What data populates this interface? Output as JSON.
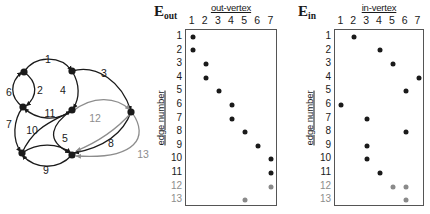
{
  "figure": {
    "panels": [
      "graph",
      "E_out matrix",
      "E_in matrix"
    ]
  },
  "graph": {
    "name": "directed-multigraph",
    "vertices": [
      {
        "id": "v1",
        "label": "",
        "x": 24,
        "y": 72
      },
      {
        "id": "v2",
        "label": "",
        "x": 72,
        "y": 71
      },
      {
        "id": "v3",
        "label": "",
        "x": 23,
        "y": 107
      },
      {
        "id": "v4",
        "label": "",
        "x": 72,
        "y": 110
      },
      {
        "id": "v5",
        "label": "",
        "x": 22,
        "y": 153
      },
      {
        "id": "v6",
        "label": "",
        "x": 72,
        "y": 155
      },
      {
        "id": "v7",
        "label": "",
        "x": 131,
        "y": 112
      }
    ],
    "edge_labels": [
      {
        "id": "1",
        "text": "1",
        "x": 48,
        "y": 59,
        "gray": false
      },
      {
        "id": "2",
        "text": "2",
        "x": 40,
        "y": 90,
        "gray": false
      },
      {
        "id": "3",
        "text": "3",
        "x": 104,
        "y": 73,
        "gray": false
      },
      {
        "id": "4",
        "text": "4",
        "x": 63,
        "y": 90,
        "gray": false
      },
      {
        "id": "5",
        "text": "5",
        "x": 65,
        "y": 138,
        "gray": false
      },
      {
        "id": "6",
        "text": "6",
        "x": 9,
        "y": 92,
        "gray": false
      },
      {
        "id": "7",
        "text": "7",
        "x": 9,
        "y": 124,
        "gray": false
      },
      {
        "id": "8",
        "text": "8",
        "x": 111,
        "y": 143,
        "gray": false
      },
      {
        "id": "9",
        "text": "9",
        "x": 46,
        "y": 170,
        "gray": false
      },
      {
        "id": "10",
        "text": "10",
        "x": 32,
        "y": 130,
        "gray": false
      },
      {
        "id": "11",
        "text": "11",
        "x": 50,
        "y": 113,
        "gray": false
      },
      {
        "id": "12",
        "text": "12",
        "x": 95,
        "y": 118,
        "gray": true
      },
      {
        "id": "13",
        "text": "13",
        "x": 143,
        "y": 154,
        "gray": true
      }
    ]
  },
  "eout": {
    "symbol": "E",
    "subscript": "out",
    "column_title": "out-vertex",
    "column_labels": [
      "1",
      "2",
      "3",
      "4",
      "5",
      "6",
      "7"
    ],
    "row_axis_title": "edge number",
    "row_labels": [
      "1",
      "2",
      "3",
      "4",
      "5",
      "6",
      "7",
      "8",
      "9",
      "10",
      "11",
      "12",
      "13"
    ]
  },
  "ein": {
    "symbol": "E",
    "subscript": "in",
    "column_title": "in-vertex",
    "column_labels": [
      "1",
      "2",
      "3",
      "4",
      "5",
      "6",
      "7"
    ],
    "row_axis_title": "edge number",
    "row_labels": [
      "1",
      "2",
      "3",
      "4",
      "5",
      "6",
      "7",
      "8",
      "9",
      "10",
      "11",
      "12",
      "13"
    ]
  },
  "chart_data": [
    {
      "type": "scatter",
      "name": "E_out",
      "title": "E_out",
      "xlabel": "out-vertex",
      "ylabel": "edge number",
      "x": [
        1,
        2,
        3,
        4,
        5,
        6,
        7
      ],
      "y": [
        1,
        2,
        3,
        4,
        5,
        6,
        7,
        8,
        9,
        10,
        11,
        12,
        13
      ],
      "xlim": [
        0.5,
        7.5
      ],
      "ylim": [
        0.5,
        13.5
      ],
      "grid": false,
      "points": [
        {
          "edge": 1,
          "vertex": 1,
          "color": "#1a1a1a"
        },
        {
          "edge": 2,
          "vertex": 1,
          "color": "#1a1a1a"
        },
        {
          "edge": 3,
          "vertex": 2,
          "color": "#1a1a1a"
        },
        {
          "edge": 4,
          "vertex": 2,
          "color": "#1a1a1a"
        },
        {
          "edge": 5,
          "vertex": 3,
          "color": "#1a1a1a"
        },
        {
          "edge": 6,
          "vertex": 4,
          "color": "#1a1a1a"
        },
        {
          "edge": 7,
          "vertex": 4,
          "color": "#1a1a1a"
        },
        {
          "edge": 8,
          "vertex": 5,
          "color": "#1a1a1a"
        },
        {
          "edge": 9,
          "vertex": 6,
          "color": "#1a1a1a"
        },
        {
          "edge": 10,
          "vertex": 7,
          "color": "#1a1a1a"
        },
        {
          "edge": 11,
          "vertex": 7,
          "color": "#1a1a1a"
        },
        {
          "edge": 12,
          "vertex": 7,
          "color": "#8a8a8a"
        },
        {
          "edge": 13,
          "vertex": 5,
          "color": "#8a8a8a"
        }
      ]
    },
    {
      "type": "scatter",
      "name": "E_in",
      "title": "E_in",
      "xlabel": "in-vertex",
      "ylabel": "edge number",
      "x": [
        1,
        2,
        3,
        4,
        5,
        6,
        7
      ],
      "y": [
        1,
        2,
        3,
        4,
        5,
        6,
        7,
        8,
        9,
        10,
        11,
        12,
        13
      ],
      "xlim": [
        0.5,
        7.5
      ],
      "ylim": [
        0.5,
        13.5
      ],
      "grid": false,
      "points": [
        {
          "edge": 1,
          "vertex": 2,
          "color": "#1a1a1a"
        },
        {
          "edge": 2,
          "vertex": 4,
          "color": "#1a1a1a"
        },
        {
          "edge": 3,
          "vertex": 5,
          "color": "#1a1a1a"
        },
        {
          "edge": 4,
          "vertex": 7,
          "color": "#1a1a1a"
        },
        {
          "edge": 5,
          "vertex": 6,
          "color": "#1a1a1a"
        },
        {
          "edge": 6,
          "vertex": 1,
          "color": "#1a1a1a"
        },
        {
          "edge": 7,
          "vertex": 3,
          "color": "#1a1a1a"
        },
        {
          "edge": 8,
          "vertex": 6,
          "color": "#1a1a1a"
        },
        {
          "edge": 9,
          "vertex": 3,
          "color": "#1a1a1a"
        },
        {
          "edge": 10,
          "vertex": 3,
          "color": "#1a1a1a"
        },
        {
          "edge": 11,
          "vertex": 4,
          "color": "#1a1a1a"
        },
        {
          "edge": 12,
          "vertex": 5,
          "color": "#8a8a8a"
        },
        {
          "edge": 12,
          "vertex": 6,
          "color": "#8a8a8a"
        },
        {
          "edge": 13,
          "vertex": 6,
          "color": "#8a8a8a"
        }
      ]
    }
  ]
}
